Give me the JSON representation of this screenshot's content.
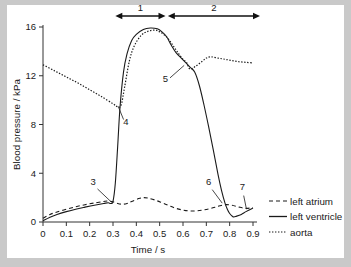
{
  "chart_data": {
    "type": "line",
    "title": "",
    "xlabel": "Time / s",
    "ylabel": "Blood pressure / kPa",
    "xlim": [
      0,
      0.9
    ],
    "ylim": [
      0,
      16
    ],
    "xticks": [
      "0",
      "0.1",
      "0.2",
      "0.3",
      "0.4",
      "0.5",
      "0.6",
      "0.7",
      "0.8",
      "0.9"
    ],
    "xtick_values": [
      0,
      0.1,
      0.2,
      0.3,
      0.4,
      0.5,
      0.6,
      0.7,
      0.8,
      0.9
    ],
    "yticks": [
      "0",
      "4",
      "8",
      "12",
      "16"
    ],
    "ytick_values": [
      0,
      4,
      8,
      12,
      16
    ],
    "grid": false,
    "legend_position": "right",
    "series": [
      {
        "name": "left atrium",
        "style": "dashed",
        "x": [
          0.0,
          0.03,
          0.06,
          0.1,
          0.14,
          0.18,
          0.22,
          0.26,
          0.28,
          0.3,
          0.32,
          0.34,
          0.36,
          0.38,
          0.41,
          0.43,
          0.45,
          0.48,
          0.51,
          0.54,
          0.57,
          0.6,
          0.63,
          0.66,
          0.69,
          0.72,
          0.75,
          0.78,
          0.81,
          0.84,
          0.87,
          0.9
        ],
        "y": [
          0.3,
          0.62,
          0.82,
          1.05,
          1.25,
          1.42,
          1.56,
          1.68,
          1.72,
          1.66,
          1.52,
          1.46,
          1.52,
          1.68,
          1.92,
          2.0,
          1.96,
          1.8,
          1.58,
          1.34,
          1.12,
          0.98,
          0.9,
          0.92,
          1.0,
          1.12,
          1.28,
          1.42,
          1.38,
          1.22,
          1.12,
          1.18
        ]
      },
      {
        "name": "left ventricle",
        "style": "solid",
        "x": [
          0.0,
          0.03,
          0.06,
          0.1,
          0.14,
          0.18,
          0.22,
          0.26,
          0.28,
          0.29,
          0.3,
          0.31,
          0.32,
          0.33,
          0.345,
          0.36,
          0.38,
          0.4,
          0.43,
          0.46,
          0.49,
          0.51,
          0.53,
          0.55,
          0.57,
          0.6,
          0.63,
          0.65,
          0.67,
          0.69,
          0.71,
          0.73,
          0.75,
          0.765,
          0.78,
          0.79,
          0.8,
          0.815,
          0.83,
          0.85,
          0.87,
          0.9
        ],
        "y": [
          0.1,
          0.4,
          0.62,
          0.85,
          1.05,
          1.22,
          1.38,
          1.52,
          1.58,
          1.52,
          1.7,
          3.2,
          6.2,
          9.4,
          12.3,
          13.8,
          14.9,
          15.4,
          15.8,
          15.92,
          15.85,
          15.6,
          15.2,
          14.5,
          13.9,
          13.3,
          12.7,
          12.3,
          11.2,
          9.6,
          7.8,
          5.9,
          3.9,
          2.6,
          1.55,
          1.05,
          0.7,
          0.42,
          0.48,
          0.62,
          0.85,
          1.15
        ]
      },
      {
        "name": "aorta",
        "style": "dotted",
        "x": [
          0.0,
          0.05,
          0.1,
          0.15,
          0.2,
          0.25,
          0.3,
          0.32,
          0.335,
          0.35,
          0.37,
          0.39,
          0.42,
          0.45,
          0.48,
          0.5,
          0.52,
          0.54,
          0.56,
          0.58,
          0.6,
          0.615,
          0.63,
          0.655,
          0.68,
          0.7,
          0.72,
          0.75,
          0.78,
          0.81,
          0.84,
          0.87,
          0.9
        ],
        "y": [
          12.9,
          12.4,
          11.9,
          11.4,
          10.85,
          10.3,
          9.7,
          9.45,
          9.6,
          11.1,
          13.2,
          14.4,
          15.3,
          15.65,
          15.75,
          15.6,
          15.35,
          14.95,
          14.4,
          13.85,
          13.35,
          13.1,
          12.55,
          12.8,
          13.15,
          13.45,
          13.55,
          13.45,
          13.35,
          13.25,
          13.15,
          13.1,
          13.05
        ]
      }
    ],
    "annotations": [
      {
        "label": "1",
        "type": "span-arrow",
        "x_start": 0.31,
        "x_end": 0.525,
        "y": 16.9
      },
      {
        "label": "2",
        "type": "span-arrow",
        "x_start": 0.535,
        "x_end": 0.93,
        "y": 16.9
      },
      {
        "label": "3",
        "type": "callout",
        "label_x": 0.215,
        "label_y": 3.05,
        "point_x": 0.295,
        "point_y": 1.6
      },
      {
        "label": "4",
        "type": "callout",
        "label_x": 0.355,
        "label_y": 7.95,
        "point_x": 0.322,
        "point_y": 9.5
      },
      {
        "label": "5",
        "type": "callout",
        "label_x": 0.525,
        "label_y": 11.5,
        "point_x": 0.605,
        "point_y": 12.85
      },
      {
        "label": "6",
        "type": "callout",
        "label_x": 0.71,
        "label_y": 3.05,
        "point_x": 0.768,
        "point_y": 1.55
      },
      {
        "label": "7",
        "type": "callout",
        "label_x": 0.855,
        "label_y": 2.65,
        "point_x": 0.872,
        "point_y": 1.05
      }
    ]
  },
  "legend": {
    "items": [
      {
        "label": "left atrium",
        "style": "dashed"
      },
      {
        "label": "left ventricle",
        "style": "solid"
      },
      {
        "label": "aorta",
        "style": "dotted"
      }
    ]
  }
}
